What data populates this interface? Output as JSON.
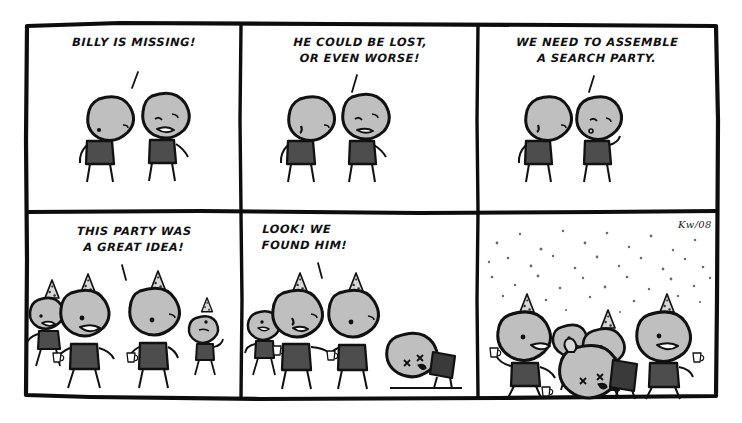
{
  "comic": {
    "title": "Billy Is Missing",
    "signature": "Kw/08",
    "background_color": "#ffffff",
    "ink_color": "#0d0d0d",
    "head_fill": "#bfbfbf",
    "body_fill": "#4d4d4d",
    "panels": [
      {
        "index": 1,
        "name": "panel-billy-is-missing",
        "caption": "BILLY IS MISSING!",
        "caption_align": "center",
        "characters": 2,
        "has_confetti": false
      },
      {
        "index": 2,
        "name": "panel-could-be-lost",
        "caption": "HE COULD BE LOST,\nOR EVEN WORSE!",
        "caption_align": "center",
        "characters": 2,
        "has_confetti": false
      },
      {
        "index": 3,
        "name": "panel-search-party",
        "caption": "WE NEED TO ASSEMBLE\nA SEARCH PARTY.",
        "caption_align": "center",
        "characters": 2,
        "has_confetti": false
      },
      {
        "index": 4,
        "name": "panel-great-idea",
        "caption": "THIS PARTY WAS\nA GREAT IDEA!",
        "caption_align": "center",
        "characters": 4,
        "has_confetti": false
      },
      {
        "index": 5,
        "name": "panel-found-him",
        "caption": "LOOK! WE\nFOUND HIM!",
        "caption_align": "center",
        "characters": 4,
        "has_confetti": false
      },
      {
        "index": 6,
        "name": "panel-celebration",
        "caption": "",
        "caption_align": "center",
        "characters": 5,
        "has_confetti": true
      }
    ]
  }
}
